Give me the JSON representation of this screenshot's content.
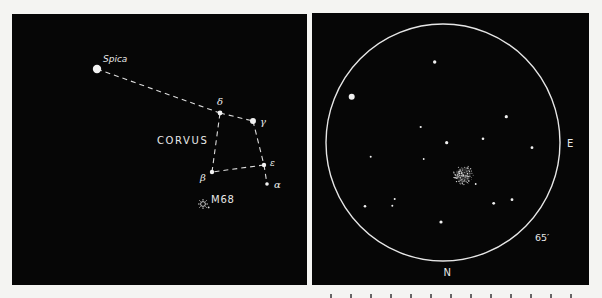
{
  "finder_chart": {
    "constellation_label": "CORVUS",
    "stars": [
      {
        "id": "spica",
        "label": "Spica",
        "x": 85,
        "y": 55,
        "r": 4.2
      },
      {
        "id": "delta",
        "label": "δ",
        "x": 208,
        "y": 99,
        "r": 2.4
      },
      {
        "id": "gamma",
        "label": "γ",
        "x": 241,
        "y": 107,
        "r": 3.0
      },
      {
        "id": "epsilon",
        "label": "ε",
        "x": 252,
        "y": 151,
        "r": 2.2
      },
      {
        "id": "beta",
        "label": "β",
        "x": 200,
        "y": 158,
        "r": 2.2
      },
      {
        "id": "alpha",
        "label": "α",
        "x": 255,
        "y": 170,
        "r": 1.8
      }
    ],
    "lines": [
      [
        "spica",
        "delta"
      ],
      [
        "delta",
        "gamma"
      ],
      [
        "gamma",
        "epsilon"
      ],
      [
        "epsilon",
        "alpha"
      ],
      [
        "epsilon",
        "beta"
      ],
      [
        "beta",
        "delta"
      ]
    ],
    "object": {
      "id": "m68",
      "label": "M68",
      "symbol": "globular-cluster-icon"
    }
  },
  "eyepiece_view": {
    "field_of_view_label": "65′",
    "direction_east": "E",
    "direction_north": "N",
    "stars": [
      {
        "x": 122.7,
        "y": 49,
        "r": 1.7
      },
      {
        "x": 39.7,
        "y": 83.7,
        "r": 3.0
      },
      {
        "x": 108.7,
        "y": 114,
        "r": 1.1
      },
      {
        "x": 134.7,
        "y": 129.7,
        "r": 1.6
      },
      {
        "x": 194.3,
        "y": 103.7,
        "r": 1.6
      },
      {
        "x": 171,
        "y": 125.7,
        "r": 1.3
      },
      {
        "x": 220,
        "y": 134.7,
        "r": 1.4
      },
      {
        "x": 58.7,
        "y": 143.7,
        "r": 1.0
      },
      {
        "x": 111.7,
        "y": 146,
        "r": 0.9
      },
      {
        "x": 53,
        "y": 193.3,
        "r": 1.3
      },
      {
        "x": 82.7,
        "y": 186,
        "r": 1.0
      },
      {
        "x": 80.3,
        "y": 192.7,
        "r": 1.0
      },
      {
        "x": 129,
        "y": 209,
        "r": 1.6
      },
      {
        "x": 181.7,
        "y": 190.3,
        "r": 1.4
      },
      {
        "x": 200,
        "y": 186.7,
        "r": 1.4
      },
      {
        "x": 163.7,
        "y": 171,
        "r": 0.9
      }
    ],
    "cluster": {
      "name": "M68",
      "x": 151.3,
      "y": 162,
      "r": 10,
      "points": 140
    }
  }
}
